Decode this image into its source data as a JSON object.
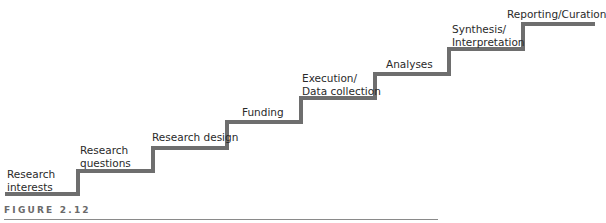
{
  "diagram": {
    "type": "staircase",
    "stroke_color": "#6e6e6e",
    "stroke_width": 4,
    "steps": [
      {
        "label": "Research\ninterests",
        "label_x": 7,
        "label_y": 168
      },
      {
        "label": "Research\nquestions",
        "label_x": 80,
        "label_y": 144
      },
      {
        "label": "Research design",
        "label_x": 152,
        "label_y": 131
      },
      {
        "label": "Funding",
        "label_x": 242,
        "label_y": 106
      },
      {
        "label": "Execution/\nData collection",
        "label_x": 302,
        "label_y": 72
      },
      {
        "label": "Analyses",
        "label_x": 386,
        "label_y": 58
      },
      {
        "label": "Synthesis/\nInterpretation",
        "label_x": 452,
        "label_y": 23
      },
      {
        "label": "Reporting/Curation",
        "label_x": 507,
        "label_y": 8
      }
    ],
    "path_points": [
      [
        5,
        194
      ],
      [
        78,
        194
      ],
      [
        78,
        171
      ],
      [
        153,
        171
      ],
      [
        153,
        148
      ],
      [
        227,
        148
      ],
      [
        227,
        122
      ],
      [
        301,
        122
      ],
      [
        301,
        98
      ],
      [
        375,
        98
      ],
      [
        375,
        74
      ],
      [
        449,
        74
      ],
      [
        449,
        49
      ],
      [
        523,
        49
      ],
      [
        523,
        24
      ],
      [
        595,
        24
      ]
    ]
  },
  "caption": {
    "text": "FIGURE 2.12"
  }
}
